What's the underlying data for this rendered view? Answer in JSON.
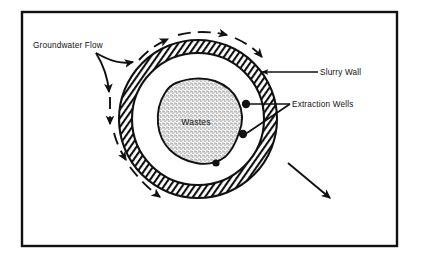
{
  "figure": {
    "title_visible": false,
    "kind": "slurry-wall containment cross-section",
    "frame": {
      "x": 22,
      "y": 12,
      "width": 375,
      "height": 234,
      "stroke": "#111111",
      "stroke_width": 2.4
    }
  },
  "colors": {
    "ink": "#111111",
    "paper": "#ffffff",
    "hatch": "#111111",
    "stipple": "#1a1a1a"
  },
  "labels": {
    "groundwater_flow": "Groundwater Flow",
    "slurry_wall": "Slurry Wall",
    "extraction_wells": "Extraction Wells",
    "wastes": "Wastes"
  },
  "geometry": {
    "ring": {
      "cx": 198,
      "cy": 119,
      "outer_r": 79,
      "inner_r": 66,
      "fill": "diagonal-hatch"
    },
    "wastes_blob": {
      "cx": 196,
      "cy": 122,
      "fill": "stipple"
    },
    "wells": [
      {
        "cx": 246,
        "cy": 104,
        "r": 4.2
      },
      {
        "cx": 243,
        "cy": 134,
        "r": 4.2
      },
      {
        "cx": 216,
        "cy": 163,
        "r": 3.6
      }
    ]
  },
  "flow": {
    "style": "dashed arcs with solid arrowheads",
    "direction": "around containment, left to right over the top and down the left side",
    "outlet_arrow": {
      "from": [
        288,
        163
      ],
      "to": [
        330,
        198
      ]
    }
  },
  "leaders": [
    {
      "name": "slurry-wall-leader",
      "from": [
        318,
        72
      ],
      "to": [
        262,
        72
      ],
      "arrow": true
    },
    {
      "name": "extraction-wells-leader-upper",
      "from": [
        290,
        104
      ],
      "to": [
        250,
        104
      ],
      "arrow": false
    },
    {
      "name": "extraction-wells-leader-lower",
      "from": [
        290,
        104
      ],
      "to": [
        247,
        133
      ],
      "arrow": false
    }
  ]
}
